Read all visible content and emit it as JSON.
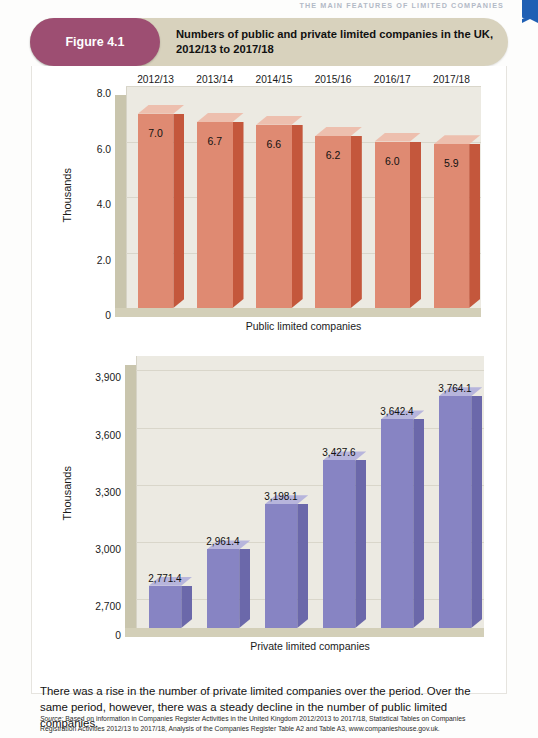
{
  "running_head": "THE MAIN FEATURES OF LIMITED COMPANIES",
  "figure": {
    "badge": "Figure 4.1",
    "title": "Numbers of public and private limited companies in the UK, 2012/13 to 2017/18"
  },
  "body_text": "There was a rise in the number of private limited companies over the period. Over the same period, however, there was a steady decline in the number of public limited companies.",
  "source": {
    "label": "Source:",
    "text": " Based on information in Companies Register Activities in the United Kingdom 2012/2013 to 2017/18, Statistical Tables on Companies Registration Activities 2012/13 to 2017/18, Analysis of the Companies Register Table A2 and Table A3, www.companieshouse.gov.uk."
  },
  "colors": {
    "badge": "#9d4e72",
    "band": "#d8d2bd",
    "public_bar": "#df8a72",
    "private_bar": "#8784c3",
    "plot_background": "#eceae2",
    "corner_tab": "#1f5fb4"
  },
  "chart_data": [
    {
      "type": "bar",
      "id": "public-limited-companies",
      "title": "Public limited companies",
      "xlabel": "Public limited companies",
      "ylabel": "Thousands",
      "categories": [
        "2012/13",
        "2013/14",
        "2014/15",
        "2015/16",
        "2016/17",
        "2017/18"
      ],
      "values": [
        7.0,
        6.7,
        6.6,
        6.2,
        6.0,
        5.9
      ],
      "value_labels": [
        "7.0",
        "6.7",
        "6.6",
        "6.2",
        "6.0",
        "5.9"
      ],
      "yticks": [
        "0",
        "2.0",
        "4.0",
        "6.0",
        "8.0"
      ],
      "ytick_values": [
        0,
        2.0,
        4.0,
        6.0,
        8.0
      ],
      "ylim": [
        0,
        8.0
      ],
      "grid": true,
      "legend": "none",
      "category_labels_position": "top"
    },
    {
      "type": "bar",
      "id": "private-limited-companies",
      "title": "Private limited companies",
      "xlabel": "Private limited companies",
      "ylabel": "Thousands",
      "categories": [
        "2012/13",
        "2013/14",
        "2014/15",
        "2015/16",
        "2016/17",
        "2017/18"
      ],
      "values": [
        2771.4,
        2961.4,
        3198.1,
        3427.6,
        3642.4,
        3764.1
      ],
      "value_labels": [
        "2,771.4",
        "2,961.4",
        "3,198.1",
        "3,427.6",
        "3,642.4",
        "3,764.1"
      ],
      "yticks": [
        "0",
        "2,700",
        "3,000",
        "3,300",
        "3,600",
        "3,900"
      ],
      "ytick_values": [
        0,
        2700,
        3000,
        3300,
        3600,
        3900
      ],
      "ylim": [
        2550,
        3975
      ],
      "grid": true,
      "legend": "none",
      "category_labels_position": "none"
    }
  ]
}
